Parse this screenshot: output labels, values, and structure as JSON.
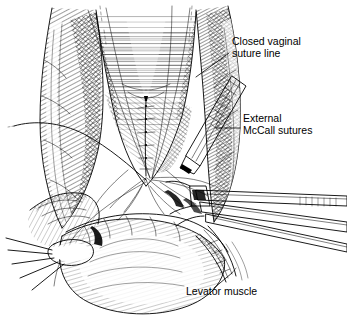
{
  "figure": {
    "background_color": "#ffffff",
    "ink_color": "#000000",
    "width": 347,
    "height": 336,
    "style": "pen-and-ink line drawing with cross-hatching"
  },
  "labels": [
    {
      "id": "closed-vaginal-suture-line",
      "line1": "Closed vaginal",
      "line2": "suture line",
      "text_x": 232,
      "text_y": 45,
      "leader": "M 229 53 L 196 77"
    },
    {
      "id": "external-mccall-sutures",
      "line1": "External",
      "line2": "McCall sutures",
      "text_x": 243,
      "text_y": 122,
      "leader": "M 240 128 L 216 128"
    },
    {
      "id": "levator-muscle",
      "line1": "Levator muscle",
      "line2": "",
      "text_x": 186,
      "text_y": 295,
      "leader": "M 214 288 L 232 273"
    }
  ],
  "anatomy": [
    {
      "id": "left-labium",
      "name": "left labium majus"
    },
    {
      "id": "right-labium",
      "name": "right labium majus"
    },
    {
      "id": "vaginal-vault",
      "name": "vaginal vault cavity"
    },
    {
      "id": "cuff-suture-line",
      "name": "closed vaginal cuff suture line"
    },
    {
      "id": "perineal-body",
      "name": "perineal body"
    },
    {
      "id": "levator-sling",
      "name": "levator ani muscle"
    }
  ],
  "instruments": [
    {
      "id": "needle-holder",
      "name": "needle holder with ribbed handle"
    },
    {
      "id": "long-forceps",
      "name": "long tissue forceps"
    },
    {
      "id": "lower-forceps",
      "name": "lower clamp"
    },
    {
      "id": "perineal-retractor",
      "name": "perineal retractor"
    }
  ]
}
